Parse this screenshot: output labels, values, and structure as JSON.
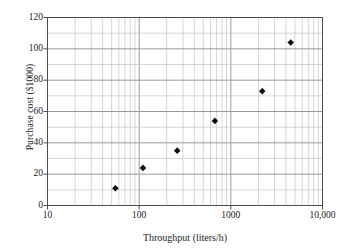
{
  "chart_data": {
    "type": "scatter",
    "title": "",
    "xlabel": "Throughput (liters/h)",
    "ylabel": "Purchase cost ($1000)",
    "xscale": "log",
    "yscale": "linear",
    "xlim": [
      10,
      10000
    ],
    "ylim": [
      0,
      120
    ],
    "grid": true,
    "legend": null,
    "x_tick_labels": [
      "10",
      "100",
      "1000",
      "10,000"
    ],
    "x_tick_values": [
      10,
      100,
      1000,
      10000
    ],
    "y_tick_labels": [
      "0",
      "20",
      "40",
      "60",
      "80",
      "100",
      "120"
    ],
    "y_tick_values": [
      0,
      20,
      40,
      60,
      80,
      100,
      120
    ],
    "y_minor_step": 10,
    "x_minor_ticks": "decade subdivisions 2-9",
    "marker": "filled-diamond",
    "marker_color": "#101010",
    "series": [
      {
        "name": "Purchase cost vs throughput",
        "points": [
          {
            "x": 55,
            "y": 11
          },
          {
            "x": 110,
            "y": 24
          },
          {
            "x": 260,
            "y": 35
          },
          {
            "x": 670,
            "y": 54
          },
          {
            "x": 2200,
            "y": 73
          },
          {
            "x": 4500,
            "y": 104
          }
        ]
      }
    ]
  },
  "axes": {
    "x_title": "Throughput (liters/h)",
    "y_title": "Purchase cost ($1000)"
  },
  "colors": {
    "frame": "#4c4c4c",
    "major_grid": "#9a9a9a",
    "minor_grid": "#c4c4c4",
    "marker": "#101010",
    "text": "#1c1c1c",
    "background": "#ffffff"
  }
}
